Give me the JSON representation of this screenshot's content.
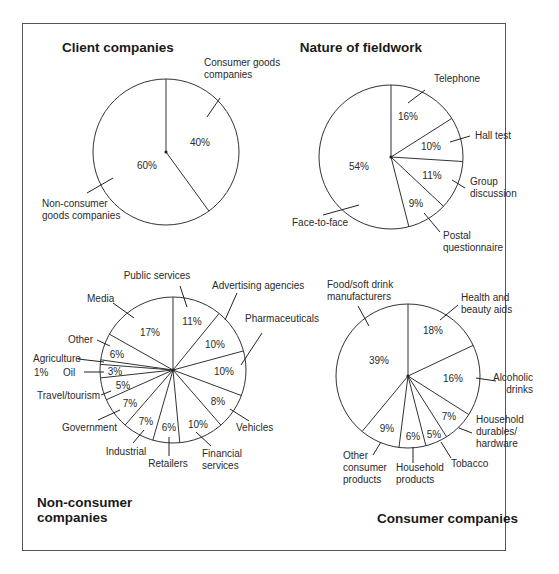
{
  "figure": {
    "frame": {
      "x": 22,
      "y": 23,
      "w": 484,
      "h": 528
    }
  },
  "chart_data": [
    {
      "type": "pie",
      "title": "Client companies",
      "title_pos": {
        "x": 62,
        "y": 52,
        "anchor": "start"
      },
      "center": {
        "x": 166,
        "y": 152
      },
      "radius": 73,
      "start_angle_deg": 0,
      "direction": "clockwise",
      "slices": [
        {
          "label": "Consumer goods companies",
          "value": 40,
          "pct": "40%",
          "pct_pos": {
            "x": 200,
            "y": 146
          },
          "label_lines": [
            "Consumer goods",
            "companies"
          ],
          "label_pos": {
            "x": 204,
            "y": 66,
            "anchor": "start"
          },
          "leader": [
            [
              220,
              98
            ],
            [
              207,
              117
            ]
          ]
        },
        {
          "label": "Non-consumer goods companies",
          "value": 60,
          "pct": "60%",
          "pct_pos": {
            "x": 147,
            "y": 169
          },
          "label_lines": [
            "Non-consumer",
            "goods companies"
          ],
          "label_pos": {
            "x": 42,
            "y": 207,
            "anchor": "start"
          },
          "leader": [
            [
              87,
              193
            ],
            [
              113,
              178
            ]
          ]
        }
      ]
    },
    {
      "type": "pie",
      "title": "Nature of fieldwork",
      "title_pos": {
        "x": 361,
        "y": 52,
        "anchor": "middle"
      },
      "center": {
        "x": 391,
        "y": 157
      },
      "radius": 72,
      "start_angle_deg": 0,
      "direction": "clockwise",
      "slices": [
        {
          "label": "Telephone",
          "value": 16,
          "pct": "16%",
          "pct_pos": {
            "x": 408,
            "y": 120
          },
          "label_lines": [
            "Telephone"
          ],
          "label_pos": {
            "x": 434,
            "y": 82,
            "anchor": "start"
          },
          "leader": [
            [
              425,
              90
            ],
            [
              408,
              103
            ]
          ]
        },
        {
          "label": "Hall test",
          "value": 10,
          "pct": "10%",
          "pct_pos": {
            "x": 431,
            "y": 150
          },
          "label_lines": [
            "Hall test"
          ],
          "label_pos": {
            "x": 475,
            "y": 139,
            "anchor": "start"
          },
          "leader": [
            [
              470,
              136
            ],
            [
              450,
              142
            ]
          ]
        },
        {
          "label": "Group discussion",
          "value": 11,
          "pct": "11%",
          "pct_pos": {
            "x": 432,
            "y": 179
          },
          "label_lines": [
            "Group",
            "discussion"
          ],
          "label_pos": {
            "x": 470,
            "y": 185,
            "anchor": "start"
          },
          "leader": [
            [
              465,
              188
            ],
            [
              452,
              180
            ]
          ]
        },
        {
          "label": "Postal questionnaire",
          "value": 9,
          "pct": "9%",
          "pct_pos": {
            "x": 416,
            "y": 207
          },
          "label_lines": [
            "Postal",
            "questionnaire"
          ],
          "label_pos": {
            "x": 443,
            "y": 239,
            "anchor": "start"
          },
          "leader": [
            [
              440,
              232
            ],
            [
              424,
              213
            ]
          ]
        },
        {
          "label": "Face-to-face",
          "value": 54,
          "pct": "54%",
          "pct_pos": {
            "x": 359,
            "y": 170
          },
          "label_lines": [
            "Face-to-face"
          ],
          "label_pos": {
            "x": 292,
            "y": 226,
            "anchor": "start"
          },
          "leader": [
            [
              323,
              215
            ],
            [
              359,
              205
            ]
          ]
        }
      ]
    },
    {
      "type": "pie",
      "title": "Non-consumer companies",
      "title_lines": [
        "Non-consumer",
        "companies"
      ],
      "title_pos": {
        "x": 37,
        "y": 507,
        "anchor": "start"
      },
      "center": {
        "x": 173,
        "y": 370
      },
      "radius": 73,
      "start_angle_deg": 0,
      "direction": "clockwise",
      "slices": [
        {
          "label": "Public services",
          "value": 11,
          "pct": "11%",
          "pct_pos": {
            "x": 192,
            "y": 325
          },
          "label_lines": [
            "Public services"
          ],
          "label_pos": {
            "x": 157,
            "y": 279,
            "anchor": "middle"
          },
          "leader": [
            [
              180,
              286
            ],
            [
              187,
              307
            ]
          ]
        },
        {
          "label": "Advertising agencies",
          "value": 10,
          "pct": "10%",
          "pct_pos": {
            "x": 215,
            "y": 348
          },
          "label_lines": [
            "Advertising agencies"
          ],
          "label_pos": {
            "x": 212,
            "y": 289,
            "anchor": "start"
          },
          "leader": [
            [
              237,
              293
            ],
            [
              225,
              320
            ]
          ]
        },
        {
          "label": "Pharmaceuticals",
          "value": 10,
          "pct": "10%",
          "pct_pos": {
            "x": 224,
            "y": 375
          },
          "label_lines": [
            "Pharmaceuticals"
          ],
          "label_pos": {
            "x": 245,
            "y": 322,
            "anchor": "start"
          },
          "leader": [
            [
              262,
              333
            ],
            [
              241,
              365
            ]
          ]
        },
        {
          "label": "Vehicles",
          "value": 8,
          "pct": "8%",
          "pct_pos": {
            "x": 218,
            "y": 405
          },
          "label_lines": [
            "Vehicles"
          ],
          "label_pos": {
            "x": 236,
            "y": 431,
            "anchor": "start"
          },
          "leader": [
            [
              249,
              421
            ],
            [
              230,
              409
            ]
          ]
        },
        {
          "label": "Financial services",
          "value": 10,
          "pct": "10%",
          "pct_pos": {
            "x": 198,
            "y": 428
          },
          "label_lines": [
            "Financial",
            "services"
          ],
          "label_pos": {
            "x": 202,
            "y": 457,
            "anchor": "start"
          },
          "leader": [
            [
              211,
              446
            ],
            [
              196,
              432
            ]
          ]
        },
        {
          "label": "Retailers",
          "value": 6,
          "pct": "6%",
          "pct_pos": {
            "x": 169,
            "y": 431
          },
          "label_lines": [
            "Retailers"
          ],
          "label_pos": {
            "x": 168,
            "y": 467,
            "anchor": "middle"
          },
          "leader": [
            [
              169,
              456
            ],
            [
              169,
              437
            ]
          ]
        },
        {
          "label": "Industrial",
          "value": 7,
          "pct": "7%",
          "pct_pos": {
            "x": 146,
            "y": 425
          },
          "label_lines": [
            "Industrial"
          ],
          "label_pos": {
            "x": 126,
            "y": 455,
            "anchor": "middle"
          },
          "leader": [
            [
              133,
              443
            ],
            [
              144,
              430
            ]
          ]
        },
        {
          "label": "Government",
          "value": 7,
          "pct": "7%",
          "pct_pos": {
            "x": 130,
            "y": 407
          },
          "label_lines": [
            "Government"
          ],
          "label_pos": {
            "x": 62,
            "y": 431,
            "anchor": "start"
          },
          "leader": [
            [
              98,
              420
            ],
            [
              120,
              410
            ]
          ]
        },
        {
          "label": "Travel/tourism",
          "value": 5,
          "pct": "5%",
          "pct_pos": {
            "x": 123,
            "y": 389
          },
          "label_lines": [
            "Travel/tourism"
          ],
          "label_pos": {
            "x": 37,
            "y": 399,
            "anchor": "start"
          },
          "leader": [
            [
              101,
              395
            ],
            [
              111,
              391
            ]
          ]
        },
        {
          "label": "Oil",
          "value": 3,
          "pct": "3%",
          "pct_pos": {
            "x": 115,
            "y": 375
          },
          "label_lines": [
            "Oil"
          ],
          "label_pos": {
            "x": 63,
            "y": 376,
            "anchor": "start"
          },
          "leader": [
            [
              84,
              372
            ],
            [
              104,
              372
            ]
          ]
        },
        {
          "label": "Agriculture",
          "value": 1,
          "pct": "1%",
          "pct_pos": {
            "x": 34,
            "y": 376
          },
          "pct_anchor": "start",
          "label_lines": [
            "Agriculture"
          ],
          "label_pos": {
            "x": 33,
            "y": 362,
            "anchor": "start"
          },
          "leader": [
            [
              78,
              359
            ],
            [
              104,
              362
            ]
          ]
        },
        {
          "label": "Other",
          "value": 6,
          "pct": "6%",
          "pct_pos": {
            "x": 117,
            "y": 358
          },
          "label_lines": [
            "Other"
          ],
          "label_pos": {
            "x": 68,
            "y": 343,
            "anchor": "start"
          },
          "leader": [
            [
              97,
              340
            ],
            [
              110,
              346
            ]
          ]
        },
        {
          "label": "Media",
          "value": 17,
          "pct": "17%",
          "pct_pos": {
            "x": 150,
            "y": 336
          },
          "label_lines": [
            "Media"
          ],
          "label_pos": {
            "x": 87,
            "y": 302,
            "anchor": "start"
          },
          "leader": [
            [
              113,
              303
            ],
            [
              134,
              318
            ]
          ]
        }
      ]
    },
    {
      "type": "pie",
      "title": "Consumer companies",
      "title_pos": {
        "x": 518,
        "y": 523,
        "anchor": "end"
      },
      "center": {
        "x": 408,
        "y": 376
      },
      "radius": 72,
      "start_angle_deg": 0,
      "direction": "clockwise",
      "slices": [
        {
          "label": "Health and beauty aids",
          "value": 18,
          "pct": "18%",
          "pct_pos": {
            "x": 433,
            "y": 334
          },
          "label_lines": [
            "Health and",
            "beauty aids"
          ],
          "label_pos": {
            "x": 461,
            "y": 301,
            "anchor": "start"
          },
          "leader": [
            [
              458,
              305
            ],
            [
              440,
              320
            ]
          ]
        },
        {
          "label": "Alcoholic drinks",
          "value": 16,
          "pct": "16%",
          "pct_pos": {
            "x": 453,
            "y": 382
          },
          "label_lines": [
            "Alcoholic",
            "drinks"
          ],
          "label_pos": {
            "x": 533,
            "y": 381,
            "anchor": "end"
          },
          "leader": [
            [
              496,
              381
            ],
            [
              476,
              378
            ]
          ]
        },
        {
          "label": "Household durables/hardware",
          "value": 7,
          "pct": "7%",
          "pct_pos": {
            "x": 449,
            "y": 420
          },
          "label_lines": [
            "Household",
            "durables/",
            "hardware"
          ],
          "label_pos": {
            "x": 476,
            "y": 423,
            "anchor": "start"
          },
          "leader": [
            [
              472,
              433
            ],
            [
              459,
              428
            ]
          ]
        },
        {
          "label": "Tobacco",
          "value": 5,
          "pct": "5%",
          "pct_pos": {
            "x": 434,
            "y": 438
          },
          "label_lines": [
            "Tobacco"
          ],
          "label_pos": {
            "x": 451,
            "y": 467,
            "anchor": "start"
          },
          "leader": [
            [
              451,
              458
            ],
            [
              441,
              442
            ]
          ]
        },
        {
          "label": "Household products",
          "value": 6,
          "pct": "6%",
          "pct_pos": {
            "x": 413,
            "y": 440
          },
          "label_lines": [
            "Household",
            "products"
          ],
          "label_pos": {
            "x": 396,
            "y": 471,
            "anchor": "start"
          },
          "leader": [
            [
              413,
              463
            ],
            [
              413,
              447
            ]
          ]
        },
        {
          "label": "Other consumer products",
          "value": 9,
          "pct": "9%",
          "pct_pos": {
            "x": 387,
            "y": 432
          },
          "label_lines": [
            "Other",
            "consumer",
            "products"
          ],
          "label_pos": {
            "x": 343,
            "y": 459,
            "anchor": "start"
          },
          "leader": [
            [
              373,
              455
            ],
            [
              381,
              442
            ]
          ]
        },
        {
          "label": "Food/soft drink manufacturers",
          "value": 39,
          "pct": "39%",
          "pct_pos": {
            "x": 379,
            "y": 364
          },
          "label_lines": [
            "Food/soft drink",
            "manufacturers"
          ],
          "label_pos": {
            "x": 327,
            "y": 288,
            "anchor": "start"
          },
          "leader": [
            [
              358,
              306
            ],
            [
              369,
              326
            ]
          ]
        }
      ]
    }
  ]
}
